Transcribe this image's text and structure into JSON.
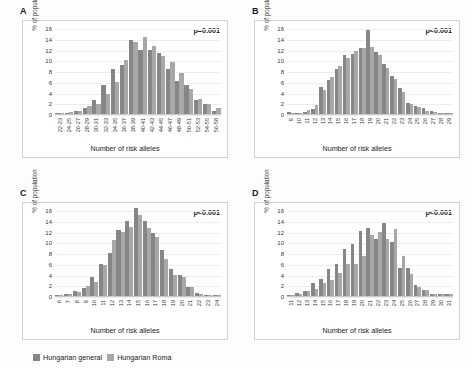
{
  "figure": {
    "ylabel": "% of population",
    "xlabel": "Number of risk alleles",
    "ylim": [
      0,
      16
    ],
    "yticks": [
      0,
      2,
      4,
      6,
      8,
      10,
      12,
      14,
      16
    ],
    "colors": {
      "hungarian_general": "#868686",
      "hungarian_roma": "#a8a8a8"
    }
  },
  "legend": {
    "items": [
      {
        "label": "Hungarian general",
        "color": "#868686"
      },
      {
        "label": "Hungarian Roma",
        "color": "#a8a8a8"
      }
    ]
  },
  "panels": [
    {
      "letter": "A",
      "pvalue": "p=0.001"
    },
    {
      "letter": "B",
      "pvalue": "p<0.001"
    },
    {
      "letter": "C",
      "pvalue": "p<0.001"
    },
    {
      "letter": "D",
      "pvalue": "p<0.001"
    }
  ],
  "chart_data": [
    {
      "panel": "A",
      "type": "bar",
      "title": "A",
      "annotation": "p=0.001",
      "xlabel": "Number of risk alleles",
      "ylabel": "% of population",
      "ylim": [
        0,
        16
      ],
      "yticks": [
        0,
        2,
        4,
        6,
        8,
        10,
        12,
        14,
        16
      ],
      "grid": true,
      "legend_position": "figure-bottom",
      "categories": [
        "22-23",
        "24-25",
        "26-27",
        "28-29",
        "30-31",
        "32-33",
        "34-35",
        "36-37",
        "38-39",
        "40-41",
        "42-43",
        "44-45",
        "46-47",
        "48-49",
        "50-51",
        "52-53",
        "54-55",
        "56-58"
      ],
      "series": [
        {
          "name": "Hungarian general",
          "values": [
            0.1,
            0.2,
            0.5,
            1.1,
            2.7,
            5.4,
            8.4,
            9.1,
            13.7,
            11.9,
            11.9,
            11.4,
            8.4,
            6.2,
            5.4,
            2.6,
            1.8,
            0.6
          ]
        },
        {
          "name": "Hungarian Roma",
          "values": [
            0.1,
            0.3,
            0.6,
            1.4,
            1.8,
            3.7,
            5.9,
            10.0,
            13.4,
            14.3,
            12.7,
            10.8,
            9.7,
            7.7,
            4.7,
            2.8,
            1.9,
            1.2
          ]
        }
      ]
    },
    {
      "panel": "B",
      "type": "bar",
      "title": "B",
      "annotation": "p<0.001",
      "xlabel": "Number of risk alleles",
      "ylabel": "% of population",
      "ylim": [
        0,
        16
      ],
      "yticks": [
        0,
        2,
        4,
        6,
        8,
        10,
        12,
        14,
        16
      ],
      "grid": true,
      "legend_position": "figure-bottom",
      "categories": [
        "9",
        "10",
        "11",
        "12",
        "13",
        "14",
        "15",
        "16",
        "17",
        "18",
        "19",
        "20",
        "21",
        "22",
        "23",
        "24",
        "25",
        "26",
        "27",
        "28",
        "29"
      ],
      "series": [
        {
          "name": "Hungarian general",
          "values": [
            0.3,
            0.2,
            0.4,
            1.0,
            5.0,
            6.4,
            8.3,
            10.9,
            11.2,
            12.2,
            15.7,
            11.6,
            9.3,
            7.1,
            4.8,
            2.0,
            1.4,
            1.1,
            0.5,
            0.1,
            0.1
          ]
        },
        {
          "name": "Hungarian Roma",
          "values": [
            0.1,
            0.2,
            0.7,
            1.7,
            4.4,
            6.8,
            8.9,
            10.4,
            11.8,
            12.2,
            12.4,
            11.0,
            8.5,
            6.6,
            4.1,
            1.9,
            1.3,
            0.6,
            0.3,
            0.1,
            0.1
          ]
        }
      ]
    },
    {
      "panel": "C",
      "type": "bar",
      "title": "C",
      "annotation": "p<0.001",
      "xlabel": "Number of risk alleles",
      "ylabel": "% of population",
      "ylim": [
        0,
        16
      ],
      "yticks": [
        0,
        2,
        4,
        6,
        8,
        10,
        12,
        14,
        16
      ],
      "grid": true,
      "legend_position": "figure-bottom",
      "categories": [
        "6",
        "7",
        "8",
        "9",
        "10",
        "11",
        "12",
        "13",
        "14",
        "15",
        "16",
        "17",
        "18",
        "19",
        "20",
        "21",
        "22",
        "23",
        "24"
      ],
      "series": [
        {
          "name": "Hungarian general",
          "values": [
            0.2,
            0.3,
            0.9,
            1.4,
            3.5,
            5.9,
            8.0,
            12.3,
            14.0,
            16.4,
            14.0,
            11.8,
            8.5,
            5.0,
            3.9,
            1.7,
            0.5,
            0.2,
            0.2
          ]
        },
        {
          "name": "Hungarian Roma",
          "values": [
            0.2,
            0.3,
            0.7,
            1.8,
            2.7,
            5.8,
            10.5,
            12.0,
            12.9,
            15.0,
            12.7,
            11.0,
            6.9,
            4.0,
            3.5,
            1.6,
            0.4,
            0.2,
            0.2
          ]
        }
      ]
    },
    {
      "panel": "D",
      "type": "bar",
      "title": "D",
      "annotation": "p<0.001",
      "xlabel": "Number of risk alleles",
      "ylabel": "% of population",
      "ylim": [
        0,
        16
      ],
      "yticks": [
        0,
        2,
        4,
        6,
        8,
        10,
        12,
        14,
        16
      ],
      "grid": true,
      "legend_position": "figure-bottom",
      "categories": [
        "11",
        "12",
        "13",
        "14",
        "15",
        "16",
        "17",
        "18",
        "19",
        "20",
        "21",
        "22",
        "23",
        "24",
        "25",
        "26",
        "27",
        "28",
        "29",
        "30",
        "31"
      ],
      "series": [
        {
          "name": "Hungarian general",
          "values": [
            0.1,
            0.5,
            0.9,
            2.4,
            3.2,
            5.0,
            6.0,
            8.8,
            9.6,
            12.1,
            12.7,
            10.7,
            13.6,
            10.0,
            5.3,
            5.3,
            2.0,
            1.2,
            0.4,
            0.4,
            0.3
          ]
        },
        {
          "name": "Hungarian Roma",
          "values": [
            0.1,
            0.3,
            0.9,
            1.3,
            2.4,
            3.0,
            4.2,
            6.0,
            5.9,
            7.4,
            11.3,
            11.9,
            10.7,
            12.5,
            7.4,
            4.1,
            1.7,
            1.2,
            0.4,
            0.4,
            0.3
          ]
        }
      ]
    }
  ]
}
